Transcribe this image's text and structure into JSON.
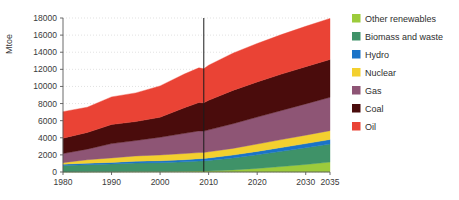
{
  "chart_data": {
    "type": "area",
    "stacked": true,
    "title": "",
    "xlabel": "",
    "ylabel": "Mtoe",
    "xlim": [
      1980,
      2035
    ],
    "ylim": [
      0,
      18000
    ],
    "ytick_step": 2000,
    "yticks": [
      "0",
      "2000",
      "4000",
      "6000",
      "8000",
      "10000",
      "12000",
      "14000",
      "16000",
      "18000"
    ],
    "xticks": [
      "1980",
      "1990",
      "2000",
      "2010",
      "2020",
      "2030",
      "2035"
    ],
    "xtick_values": [
      1980,
      1990,
      2000,
      2010,
      2020,
      2030,
      2035
    ],
    "grid": "horizontal-dotted",
    "legend_position": "right",
    "divider_year": 2009,
    "divider_note": "historical / projection divider",
    "x": [
      1980,
      1985,
      1990,
      1995,
      2000,
      2005,
      2008,
      2009,
      2010,
      2015,
      2020,
      2025,
      2030,
      2035
    ],
    "series": [
      {
        "name": "Oil",
        "color": "#ea4335",
        "values": [
          3100,
          2950,
          3230,
          3350,
          3660,
          3950,
          4050,
          3980,
          4100,
          4350,
          4500,
          4620,
          4720,
          4800
        ]
      },
      {
        "name": "Coal",
        "color": "#4a0c0c",
        "values": [
          1800,
          1950,
          2230,
          2220,
          2340,
          2990,
          3320,
          3300,
          3450,
          3900,
          4100,
          4250,
          4350,
          4420
        ]
      },
      {
        "name": "Gas",
        "color": "#8e5575",
        "values": [
          1060,
          1240,
          1670,
          1800,
          2070,
          2360,
          2530,
          2490,
          2560,
          2880,
          3150,
          3400,
          3650,
          3900
        ]
      },
      {
        "name": "Nuclear",
        "color": "#f3d02f",
        "values": [
          186,
          400,
          526,
          608,
          676,
          721,
          712,
          703,
          719,
          780,
          860,
          930,
          990,
          1030
        ]
      },
      {
        "name": "Hydro",
        "color": "#1a73c8",
        "values": [
          148,
          184,
          184,
          222,
          225,
          251,
          276,
          280,
          295,
          340,
          390,
          440,
          490,
          540
        ]
      },
      {
        "name": "Biomass and waste",
        "color": "#3f9268",
        "values": [
          749,
          830,
          903,
          1000,
          1030,
          1100,
          1180,
          1200,
          1230,
          1400,
          1600,
          1780,
          1950,
          2100
        ]
      },
      {
        "name": "Other renewables",
        "color": "#9ccb3b",
        "values": [
          12,
          18,
          36,
          48,
          60,
          85,
          103,
          110,
          120,
          240,
          420,
          640,
          880,
          1160
        ]
      }
    ],
    "totals": [
      7055,
      7572,
      8779,
      9248,
      10061,
      11457,
      12171,
      12063,
      12474,
      13890,
      15020,
      16060,
      17030,
      17950
    ]
  },
  "legend": {
    "items": [
      {
        "label": "Other renewables",
        "color": "#9ccb3b"
      },
      {
        "label": "Biomass and waste",
        "color": "#3f9268"
      },
      {
        "label": "Hydro",
        "color": "#1a73c8"
      },
      {
        "label": "Nuclear",
        "color": "#f3d02f"
      },
      {
        "label": "Gas",
        "color": "#8e5575"
      },
      {
        "label": "Coal",
        "color": "#4a0c0c"
      },
      {
        "label": "Oil",
        "color": "#ea4335"
      }
    ]
  },
  "axis": {
    "y_title": "Mtoe"
  }
}
